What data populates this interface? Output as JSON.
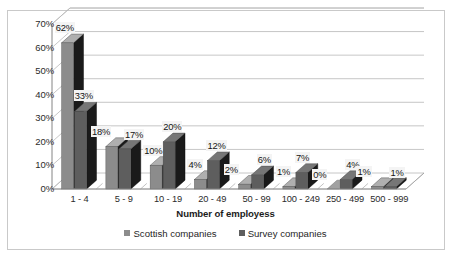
{
  "chart_data": {
    "type": "bar",
    "title": "",
    "xlabel": "Number of employess",
    "ylabel": "",
    "ylim": [
      0,
      70
    ],
    "ytick_labels": [
      "0%",
      "10%",
      "20%",
      "30%",
      "40%",
      "50%",
      "60%",
      "70%"
    ],
    "ytick_values": [
      0,
      10,
      20,
      30,
      40,
      50,
      60,
      70
    ],
    "grid": true,
    "legend_position": "bottom",
    "categories": [
      "1 - 4",
      "5 - 9",
      "10 - 19",
      "20 - 49",
      "50 - 99",
      "100 - 249",
      "250 - 499",
      "500 - 999"
    ],
    "series": [
      {
        "name": "Scottish companies",
        "color": "#8c8c8c",
        "values": [
          62,
          18,
          10,
          4,
          2,
          1,
          0,
          1
        ],
        "labels": [
          "62%",
          "18%",
          "10%",
          "4%",
          "2%",
          "1%",
          "0%",
          "1%"
        ]
      },
      {
        "name": "Survey companies",
        "color": "#5e5e5e",
        "values": [
          33,
          17,
          20,
          12,
          6,
          7,
          4,
          1
        ],
        "labels": [
          "33%",
          "17%",
          "20%",
          "12%",
          "6%",
          "7%",
          "4%",
          "1%"
        ]
      }
    ]
  },
  "axis": {
    "x_title": "Number of employess"
  },
  "legend": {
    "items": [
      {
        "label": "Scottish companies",
        "swatch": "legend-swatch-scottish"
      },
      {
        "label": "Survey companies",
        "swatch": "legend-swatch-survey"
      }
    ]
  },
  "colors": {
    "series_scottish": "#8c8c8c",
    "series_survey": "#5e5e5e",
    "series_side_dark": "#1a1a1a",
    "gridline": "#b8b8b8",
    "frame": "#c9c9c9",
    "floor": "#ffffff",
    "text": "#2b2b2b"
  }
}
